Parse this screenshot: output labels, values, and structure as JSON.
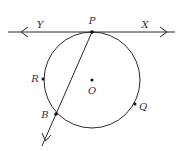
{
  "diagram": {
    "type": "geometry-circle-tangent-secant",
    "colors": {
      "stroke": "#2a2a2a",
      "label": "#333333",
      "background": "#ffffff"
    },
    "circle": {
      "center_label": "O",
      "cx": 92,
      "cy": 80,
      "r": 48
    },
    "tangent_line": {
      "x1": 8,
      "y1": 32,
      "x2": 175,
      "y2": 32,
      "left_ray_label": "Y",
      "right_ray_label": "X",
      "point_of_tangency": "P"
    },
    "secant_ray": {
      "from": "P",
      "through": "B",
      "x1": 92,
      "y1": 32,
      "x2": 42,
      "y2": 146
    },
    "points": [
      {
        "id": "P",
        "label": "P",
        "x": 92,
        "y": 32,
        "lx": 92,
        "ly": 24
      },
      {
        "id": "O",
        "label": "O",
        "x": 92,
        "y": 80,
        "lx": 92,
        "ly": 94
      },
      {
        "id": "R",
        "label": "R",
        "x": 43,
        "y": 79,
        "lx": 35,
        "ly": 82
      },
      {
        "id": "B",
        "label": "B",
        "x": 56,
        "y": 114,
        "lx": 45,
        "ly": 118
      },
      {
        "id": "Q",
        "label": "Q",
        "x": 135,
        "y": 104,
        "lx": 143,
        "ly": 110
      }
    ],
    "ray_labels": [
      {
        "id": "Y",
        "label": "Y",
        "lx": 40,
        "ly": 28
      },
      {
        "id": "X",
        "label": "X",
        "lx": 145,
        "ly": 28
      }
    ]
  }
}
